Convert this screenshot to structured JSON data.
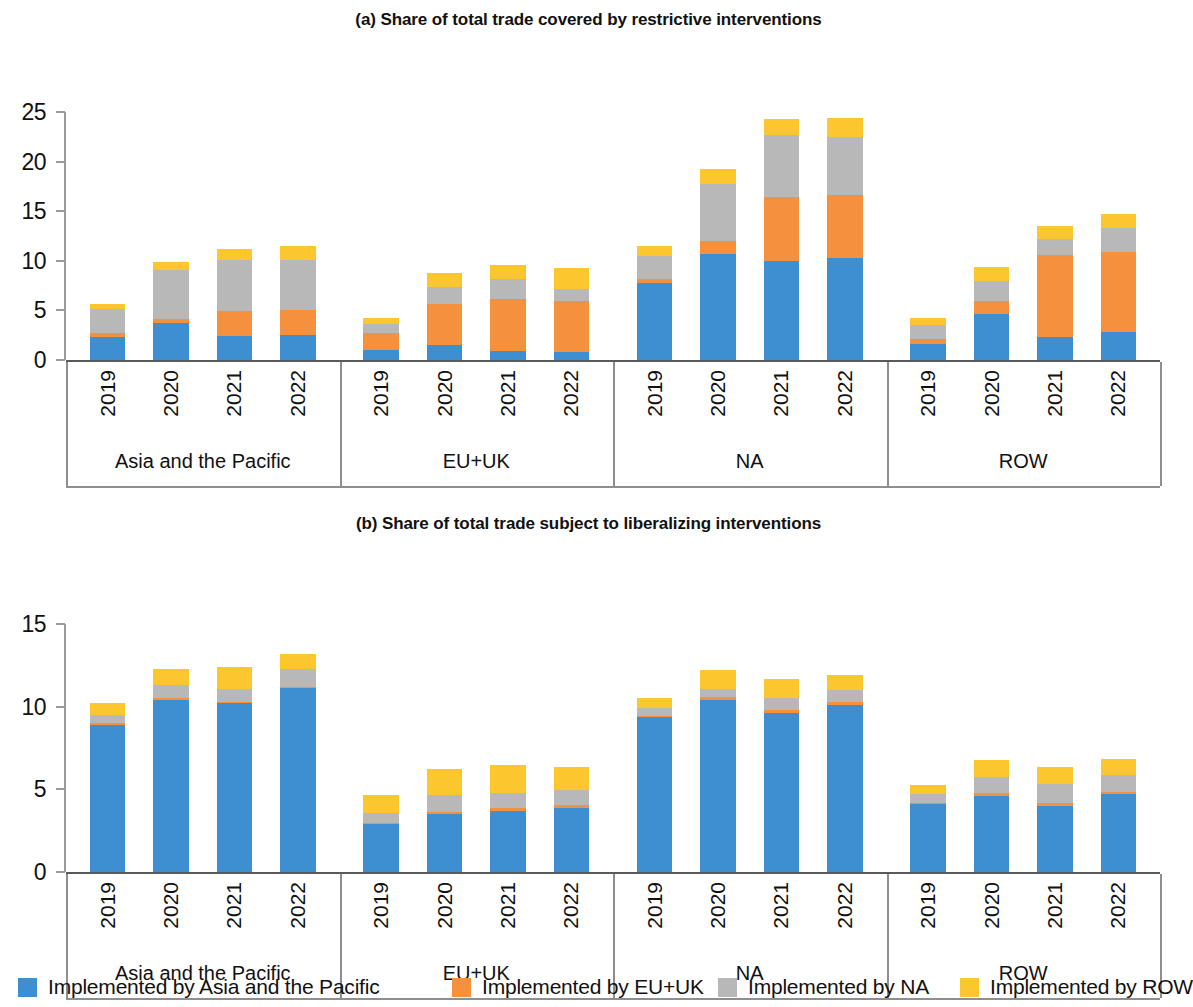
{
  "figure": {
    "panels": [
      {
        "id": "a",
        "title": "(a) Share of total trade covered by restrictive interventions"
      },
      {
        "id": "b",
        "title": "(b) Share of total trade subject to liberalizing interventions"
      }
    ]
  },
  "legend": {
    "items": [
      {
        "label": "Implemented by Asia and the Pacific",
        "color": "#3d8fd1",
        "swatch_name": "legend-swatch-asia-pacific"
      },
      {
        "label": "Implemented by EU+UK",
        "color": "#f5903c",
        "swatch_name": "legend-swatch-eu-uk"
      },
      {
        "label": "Implemented by NA",
        "color": "#b8b8b8",
        "swatch_name": "legend-swatch-na"
      },
      {
        "label": "Implemented by ROW",
        "color": "#fbc62e",
        "swatch_name": "legend-swatch-row"
      }
    ]
  },
  "chart_data": [
    {
      "type": "bar",
      "stacked": true,
      "panel": "a",
      "title": "(a) Share of total trade covered by restrictive interventions",
      "xlabel": "",
      "ylabel": "",
      "ylim": [
        0,
        25
      ],
      "yticks": [
        0,
        5,
        10,
        15,
        20,
        25
      ],
      "grid": false,
      "legend_position": "bottom",
      "groups": [
        "Asia and the Pacific",
        "EU+UK",
        "NA",
        "ROW"
      ],
      "categories": [
        "2019",
        "2020",
        "2021",
        "2022"
      ],
      "series": [
        {
          "name": "Implemented by Asia and the Pacific",
          "color": "#3d8fd1",
          "values": {
            "Asia and the Pacific": [
              2.3,
              3.7,
              2.4,
              2.5
            ],
            "EU+UK": [
              1.0,
              1.5,
              0.9,
              0.8
            ],
            "NA": [
              7.8,
              10.7,
              10.0,
              10.3
            ],
            "ROW": [
              1.6,
              4.6,
              2.3,
              2.8
            ]
          }
        },
        {
          "name": "Implemented by EU+UK",
          "color": "#f5903c",
          "values": {
            "Asia and the Pacific": [
              0.4,
              0.4,
              2.5,
              2.5
            ],
            "EU+UK": [
              1.7,
              4.1,
              5.3,
              5.2
            ],
            "NA": [
              0.4,
              1.3,
              6.4,
              6.3
            ],
            "ROW": [
              0.5,
              1.3,
              8.3,
              8.1
            ]
          }
        },
        {
          "name": "Implemented by NA",
          "color": "#b8b8b8",
          "values": {
            "Asia and the Pacific": [
              2.4,
              5.0,
              5.2,
              5.1
            ],
            "EU+UK": [
              0.9,
              1.8,
              2.0,
              1.2
            ],
            "NA": [
              2.3,
              5.7,
              6.3,
              5.9
            ],
            "ROW": [
              1.4,
              2.1,
              1.6,
              2.4
            ]
          }
        },
        {
          "name": "Implemented by ROW",
          "color": "#fbc62e",
          "values": {
            "Asia and the Pacific": [
              0.5,
              0.8,
              1.1,
              1.4
            ],
            "EU+UK": [
              0.6,
              1.4,
              1.4,
              2.1
            ],
            "NA": [
              1.0,
              1.6,
              1.6,
              1.9
            ],
            "ROW": [
              0.7,
              1.4,
              1.3,
              1.4
            ]
          }
        }
      ],
      "totals": {
        "Asia and the Pacific": [
          5.6,
          9.9,
          11.2,
          11.5
        ],
        "EU+UK": [
          4.2,
          8.8,
          9.6,
          9.3
        ],
        "NA": [
          11.5,
          19.3,
          24.3,
          24.4
        ],
        "ROW": [
          4.2,
          9.4,
          13.5,
          14.7
        ]
      }
    },
    {
      "type": "bar",
      "stacked": true,
      "panel": "b",
      "title": "(b) Share of total trade subject to liberalizing interventions",
      "xlabel": "",
      "ylabel": "",
      "ylim": [
        0,
        15
      ],
      "yticks": [
        0,
        5,
        10,
        15
      ],
      "grid": false,
      "legend_position": "bottom",
      "groups": [
        "Asia and the Pacific",
        "EU+UK",
        "NA",
        "ROW"
      ],
      "categories": [
        "2019",
        "2020",
        "2021",
        "2022"
      ],
      "series": [
        {
          "name": "Implemented by Asia and the Pacific",
          "color": "#3d8fd1",
          "values": {
            "Asia and the Pacific": [
              8.9,
              10.4,
              10.2,
              11.1
            ],
            "EU+UK": [
              2.9,
              3.5,
              3.7,
              3.9
            ],
            "NA": [
              9.4,
              10.4,
              9.6,
              10.1
            ],
            "ROW": [
              4.1,
              4.6,
              4.0,
              4.7
            ]
          }
        },
        {
          "name": "Implemented by EU+UK",
          "color": "#f5903c",
          "values": {
            "Asia and the Pacific": [
              0.1,
              0.1,
              0.1,
              0.1
            ],
            "EU+UK": [
              0.05,
              0.15,
              0.15,
              0.15
            ],
            "NA": [
              0.05,
              0.2,
              0.2,
              0.2
            ],
            "ROW": [
              0.05,
              0.15,
              0.15,
              0.15
            ]
          }
        },
        {
          "name": "Implemented by NA",
          "color": "#b8b8b8",
          "values": {
            "Asia and the Pacific": [
              0.5,
              0.8,
              0.8,
              1.1
            ],
            "EU+UK": [
              0.6,
              1.0,
              0.9,
              0.9
            ],
            "NA": [
              0.5,
              0.5,
              0.7,
              0.7
            ],
            "ROW": [
              0.6,
              1.0,
              1.2,
              1.0
            ]
          }
        },
        {
          "name": "Implemented by ROW",
          "color": "#fbc62e",
          "values": {
            "Asia and the Pacific": [
              0.7,
              1.0,
              1.3,
              0.9
            ],
            "EU+UK": [
              1.1,
              1.6,
              1.7,
              1.4
            ],
            "NA": [
              0.6,
              1.1,
              1.2,
              0.9
            ],
            "ROW": [
              0.5,
              1.0,
              1.0,
              1.0
            ]
          }
        }
      ],
      "totals": {
        "Asia and the Pacific": [
          10.2,
          12.3,
          12.4,
          13.2
        ],
        "EU+UK": [
          4.65,
          6.25,
          6.45,
          6.35
        ],
        "NA": [
          10.55,
          12.2,
          11.7,
          11.9
        ],
        "ROW": [
          5.25,
          6.75,
          6.35,
          6.85
        ]
      }
    }
  ]
}
